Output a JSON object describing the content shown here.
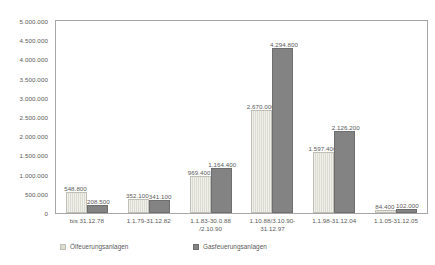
{
  "chart_data": {
    "type": "bar",
    "title": "",
    "subtitle": "",
    "xlabel": "",
    "ylabel": "",
    "ylim": [
      0,
      5000000
    ],
    "ytick_step": 500000,
    "grid": false,
    "legend_position": "bottom-left",
    "y_ticks": [
      "5.000.000",
      "4.500.000",
      "4.000.000",
      "3.500.000",
      "3.000.000",
      "2.500.000",
      "2.000.000",
      "1.500.000",
      "1.000.000",
      "500.000",
      "0"
    ],
    "y_tick_values": [
      5000000,
      4500000,
      4000000,
      3500000,
      3000000,
      2500000,
      2000000,
      1500000,
      1000000,
      500000,
      0
    ],
    "categories": [
      "bis 31.12.78",
      "1.1.79-31.12.82",
      "1.1.83-30.0.88\n/2.10.90",
      "1.10.88/3.10.90-\n31.12.97",
      "1.1.98-31.12.04",
      "1.1.05-31.12.05"
    ],
    "series": [
      {
        "name": "Ölfeuerungsanlagen",
        "key": "oil",
        "color": "#dcdcd2",
        "values": [
          548800,
          352100,
          969400,
          2670000,
          1597400,
          84400
        ],
        "labels": [
          "548.800",
          "352.100",
          "969.400",
          "2.670.000",
          "1.597.400",
          "84.400"
        ]
      },
      {
        "name": "Gasfeuerungsanlagen",
        "key": "gas",
        "color": "#838383",
        "values": [
          208500,
          341100,
          1164400,
          4294800,
          2126200,
          102000
        ],
        "labels": [
          "208.500",
          "341.100",
          "1.164.400",
          "4.294.800",
          "2.126.200",
          "102.000"
        ]
      }
    ]
  },
  "legend": {
    "items": [
      {
        "label": "Ölfeuerungsanlagen"
      },
      {
        "label": "Gasfeuerungsanlagen"
      }
    ]
  }
}
